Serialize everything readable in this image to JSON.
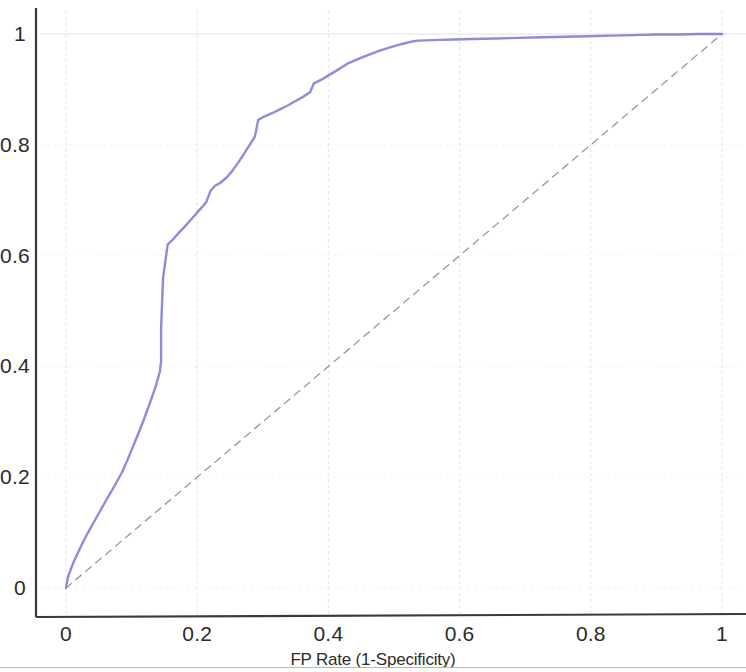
{
  "figure": {
    "type": "roc-curve",
    "background_color": "#ffffff"
  },
  "axes": {
    "x_label": "FP Rate (1-Specificity)",
    "y_label": "",
    "x_ticks": [
      "0",
      "0.2",
      "0.4",
      "0.6",
      "0.8",
      "1"
    ],
    "y_ticks": [
      "0",
      "0.2",
      "0.4",
      "0.6",
      "0.8",
      "1"
    ],
    "spine_color": "#3a3a3a",
    "grid_color": "#e2e2ee"
  },
  "series": {
    "roc_name": "ROC Curve",
    "roc_color": "#6f6fd0",
    "reference_name": "Reference diagonal",
    "reference_color": "#8d8d8d"
  },
  "chart_data": {
    "type": "line",
    "title": "",
    "subtitle": "",
    "xlabel": "FP Rate (1-Specificity)",
    "ylabel": "",
    "xlim": [
      0,
      1
    ],
    "ylim": [
      0,
      1
    ],
    "xticks": [
      0,
      0.2,
      0.4,
      0.6,
      0.8,
      1
    ],
    "yticks": [
      0,
      0.2,
      0.4,
      0.6,
      0.8,
      1
    ],
    "grid": true,
    "legend": "none",
    "annotations": [],
    "series": [
      {
        "name": "ROC Curve",
        "color": "#6f6fd0",
        "style": "solid",
        "x": [
          0.0,
          0.003,
          0.008,
          0.012,
          0.018,
          0.026,
          0.034,
          0.043,
          0.052,
          0.061,
          0.07,
          0.079,
          0.085,
          0.093,
          0.101,
          0.11,
          0.119,
          0.128,
          0.137,
          0.143,
          0.145,
          0.145,
          0.148,
          0.155,
          0.162,
          0.171,
          0.18,
          0.189,
          0.198,
          0.207,
          0.214,
          0.22,
          0.227,
          0.235,
          0.244,
          0.253,
          0.262,
          0.271,
          0.28,
          0.288,
          0.293,
          0.302,
          0.314,
          0.326,
          0.338,
          0.35,
          0.362,
          0.372,
          0.378,
          0.39,
          0.404,
          0.418,
          0.43,
          0.444,
          0.46,
          0.476,
          0.494,
          0.512,
          0.53,
          0.537,
          0.56,
          0.59,
          0.62,
          0.655,
          0.69,
          0.725,
          0.76,
          0.795,
          0.83,
          0.865,
          0.9,
          0.935,
          0.965,
          0.985,
          1.0
        ],
        "y": [
          0.0,
          0.02,
          0.036,
          0.048,
          0.063,
          0.083,
          0.101,
          0.12,
          0.139,
          0.158,
          0.176,
          0.195,
          0.208,
          0.229,
          0.252,
          0.278,
          0.305,
          0.334,
          0.365,
          0.39,
          0.41,
          0.47,
          0.56,
          0.62,
          0.628,
          0.64,
          0.651,
          0.663,
          0.675,
          0.687,
          0.697,
          0.716,
          0.726,
          0.731,
          0.74,
          0.752,
          0.767,
          0.783,
          0.8,
          0.815,
          0.845,
          0.851,
          0.857,
          0.864,
          0.871,
          0.879,
          0.887,
          0.895,
          0.911,
          0.918,
          0.928,
          0.938,
          0.947,
          0.954,
          0.962,
          0.969,
          0.976,
          0.982,
          0.987,
          0.988,
          0.989,
          0.99,
          0.991,
          0.992,
          0.993,
          0.994,
          0.995,
          0.996,
          0.997,
          0.998,
          0.999,
          0.999,
          1.0,
          1.0,
          1.0
        ]
      },
      {
        "name": "Reference diagonal",
        "color": "#8d8d8d",
        "style": "dashed",
        "x": [
          0.0,
          1.0
        ],
        "y": [
          0.0,
          1.0
        ]
      }
    ]
  }
}
